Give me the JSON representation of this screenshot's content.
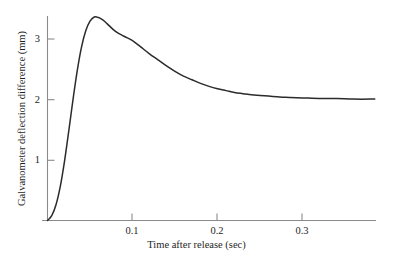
{
  "chart_data": {
    "type": "line",
    "title": "",
    "xlabel": "Time after release (sec)",
    "ylabel": "Galvanometer deflection difference (mm)",
    "xlim": [
      0,
      0.385
    ],
    "ylim": [
      0,
      3.64
    ],
    "xticks": [
      0.1,
      0.2,
      0.3
    ],
    "xtick_labels": [
      "0.1",
      "0.2",
      "0.3"
    ],
    "yticks": [
      1,
      2,
      3
    ],
    "ytick_labels": [
      "1",
      "2",
      "3"
    ],
    "grid": false,
    "legend": null,
    "line_color": "#2b2b2b",
    "axis_color": "#7d7d7d",
    "series": [
      {
        "name": "Galvanometer deflection difference",
        "steady_state": 2.0,
        "peak_value": 3.37,
        "peak_time": 0.052,
        "x": [
          0.0,
          0.005,
          0.01,
          0.015,
          0.02,
          0.025,
          0.03,
          0.035,
          0.04,
          0.045,
          0.05,
          0.055,
          0.06,
          0.065,
          0.07,
          0.08,
          0.09,
          0.1,
          0.11,
          0.12,
          0.13,
          0.14,
          0.15,
          0.16,
          0.17,
          0.18,
          0.19,
          0.2,
          0.21,
          0.22,
          0.23,
          0.24,
          0.25,
          0.26,
          0.27,
          0.28,
          0.3,
          0.32,
          0.34,
          0.36,
          0.385
        ],
        "y": [
          0.0,
          0.08,
          0.26,
          0.56,
          0.98,
          1.48,
          2.0,
          2.48,
          2.87,
          3.14,
          3.3,
          3.37,
          3.36,
          3.32,
          3.26,
          3.13,
          3.05,
          2.98,
          2.87,
          2.76,
          2.66,
          2.56,
          2.47,
          2.39,
          2.33,
          2.27,
          2.22,
          2.18,
          2.15,
          2.12,
          2.1,
          2.08,
          2.07,
          2.06,
          2.05,
          2.04,
          2.03,
          2.02,
          2.02,
          2.01,
          2.01
        ]
      }
    ]
  },
  "axes": {
    "x_title": "Time after release (sec)",
    "y_title": "Galvanometer deflection difference (mm)",
    "xtick_labels": [
      "0.1",
      "0.2",
      "0.3"
    ],
    "ytick_labels": [
      "3",
      "2",
      "1"
    ]
  }
}
